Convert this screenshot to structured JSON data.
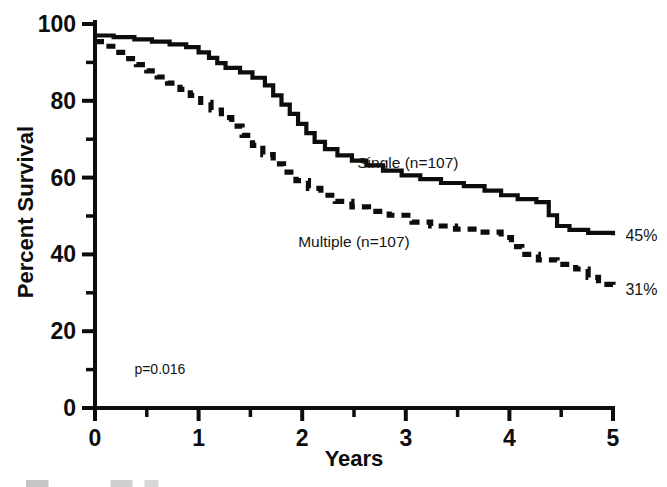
{
  "chart_data": {
    "type": "line",
    "title": "",
    "subtitle": "",
    "xlabel": "Years",
    "ylabel": "Percent Survival",
    "xlim": [
      0,
      5
    ],
    "ylim": [
      0,
      100
    ],
    "grid": false,
    "legend_position": "inline-annotations",
    "x_ticks_major": [
      0,
      1,
      2,
      3,
      4,
      5
    ],
    "x_ticks_major_labels": [
      "0",
      "1",
      "2",
      "3",
      "4",
      "5"
    ],
    "x_ticks_minor": [
      0.5,
      1.5,
      2.5,
      3.5,
      4.5
    ],
    "y_ticks_major": [
      0,
      20,
      40,
      60,
      80,
      100
    ],
    "y_ticks_major_labels": [
      "0",
      "20",
      "40",
      "60",
      "80",
      "100"
    ],
    "y_ticks_minor": [
      10,
      30,
      50,
      70,
      90
    ],
    "annotations": [
      {
        "name": "p-value",
        "text": "p=0.016",
        "x": 0.38,
        "y": 10.5
      },
      {
        "name": "single-endpoint",
        "text": "45%",
        "x": 5.12,
        "y": 45
      },
      {
        "name": "multiple-endpoint",
        "text": "31%",
        "x": 5.12,
        "y": 31
      }
    ],
    "series": [
      {
        "name": "Single",
        "label": "Single (n=107)",
        "n": 107,
        "style": "solid",
        "color": "#0d0d0d",
        "final_value": 45,
        "label_x": 3.02,
        "label_y": 62.5,
        "points": [
          [
            0.0,
            97.0
          ],
          [
            0.18,
            97.0
          ],
          [
            0.18,
            96.6
          ],
          [
            0.38,
            96.6
          ],
          [
            0.38,
            96.0
          ],
          [
            0.55,
            96.0
          ],
          [
            0.55,
            95.4
          ],
          [
            0.72,
            95.4
          ],
          [
            0.72,
            94.7
          ],
          [
            0.88,
            94.7
          ],
          [
            0.88,
            94.0
          ],
          [
            1.0,
            94.0
          ],
          [
            1.0,
            92.6
          ],
          [
            1.1,
            92.6
          ],
          [
            1.1,
            91.2
          ],
          [
            1.18,
            91.2
          ],
          [
            1.18,
            89.8
          ],
          [
            1.26,
            89.8
          ],
          [
            1.26,
            88.6
          ],
          [
            1.4,
            88.6
          ],
          [
            1.4,
            87.4
          ],
          [
            1.52,
            87.4
          ],
          [
            1.52,
            86.0
          ],
          [
            1.64,
            86.0
          ],
          [
            1.64,
            84.0
          ],
          [
            1.72,
            84.0
          ],
          [
            1.72,
            81.4
          ],
          [
            1.8,
            81.4
          ],
          [
            1.8,
            79.0
          ],
          [
            1.88,
            79.0
          ],
          [
            1.88,
            76.6
          ],
          [
            1.96,
            76.6
          ],
          [
            1.96,
            74.0
          ],
          [
            2.04,
            74.0
          ],
          [
            2.04,
            71.6
          ],
          [
            2.12,
            71.6
          ],
          [
            2.12,
            69.3
          ],
          [
            2.22,
            69.3
          ],
          [
            2.22,
            67.4
          ],
          [
            2.34,
            67.4
          ],
          [
            2.34,
            65.8
          ],
          [
            2.48,
            65.8
          ],
          [
            2.48,
            64.4
          ],
          [
            2.62,
            64.4
          ],
          [
            2.62,
            63.2
          ],
          [
            2.78,
            63.2
          ],
          [
            2.78,
            61.8
          ],
          [
            2.96,
            61.8
          ],
          [
            2.96,
            60.6
          ],
          [
            3.14,
            60.6
          ],
          [
            3.14,
            59.6
          ],
          [
            3.34,
            59.6
          ],
          [
            3.34,
            58.6
          ],
          [
            3.56,
            58.6
          ],
          [
            3.56,
            57.8
          ],
          [
            3.76,
            57.8
          ],
          [
            3.76,
            56.6
          ],
          [
            3.92,
            56.6
          ],
          [
            3.92,
            55.4
          ],
          [
            4.08,
            55.4
          ],
          [
            4.08,
            54.4
          ],
          [
            4.26,
            54.4
          ],
          [
            4.26,
            53.6
          ],
          [
            4.38,
            53.6
          ],
          [
            4.38,
            50.2
          ],
          [
            4.46,
            50.2
          ],
          [
            4.46,
            47.4
          ],
          [
            4.58,
            47.4
          ],
          [
            4.58,
            46.4
          ],
          [
            4.76,
            46.4
          ],
          [
            4.76,
            45.6
          ],
          [
            5.0,
            45.6
          ],
          [
            5.0,
            45.0
          ]
        ]
      },
      {
        "name": "Multiple",
        "label": "Multiple (n=107)",
        "n": 107,
        "style": "dashed",
        "color": "#0d0d0d",
        "final_value": 31,
        "label_x": 2.5,
        "label_y": 42.0,
        "points": [
          [
            0.0,
            95.4
          ],
          [
            0.1,
            95.4
          ],
          [
            0.1,
            94.2
          ],
          [
            0.2,
            94.2
          ],
          [
            0.2,
            92.6
          ],
          [
            0.3,
            92.6
          ],
          [
            0.3,
            91.0
          ],
          [
            0.4,
            91.0
          ],
          [
            0.4,
            89.4
          ],
          [
            0.5,
            89.4
          ],
          [
            0.5,
            87.8
          ],
          [
            0.6,
            87.8
          ],
          [
            0.6,
            86.2
          ],
          [
            0.7,
            86.2
          ],
          [
            0.7,
            84.6
          ],
          [
            0.82,
            84.6
          ],
          [
            0.82,
            83.0
          ],
          [
            0.92,
            83.0
          ],
          [
            0.92,
            81.4
          ],
          [
            1.02,
            81.4
          ],
          [
            1.02,
            79.6
          ],
          [
            1.12,
            79.6
          ],
          [
            1.12,
            77.6
          ],
          [
            1.22,
            77.6
          ],
          [
            1.22,
            75.6
          ],
          [
            1.32,
            75.6
          ],
          [
            1.32,
            73.4
          ],
          [
            1.42,
            73.4
          ],
          [
            1.42,
            71.0
          ],
          [
            1.52,
            71.0
          ],
          [
            1.52,
            68.4
          ],
          [
            1.62,
            68.4
          ],
          [
            1.62,
            66.0
          ],
          [
            1.72,
            66.0
          ],
          [
            1.72,
            63.6
          ],
          [
            1.82,
            63.6
          ],
          [
            1.82,
            61.4
          ],
          [
            1.94,
            61.4
          ],
          [
            1.94,
            59.2
          ],
          [
            2.06,
            59.2
          ],
          [
            2.06,
            57.2
          ],
          [
            2.18,
            57.2
          ],
          [
            2.18,
            55.4
          ],
          [
            2.32,
            55.4
          ],
          [
            2.32,
            53.8
          ],
          [
            2.48,
            53.8
          ],
          [
            2.48,
            52.4
          ],
          [
            2.64,
            52.4
          ],
          [
            2.64,
            51.2
          ],
          [
            2.84,
            51.2
          ],
          [
            2.84,
            50.2
          ],
          [
            3.06,
            50.2
          ],
          [
            3.06,
            48.4
          ],
          [
            3.24,
            48.4
          ],
          [
            3.24,
            47.4
          ],
          [
            3.48,
            47.4
          ],
          [
            3.48,
            46.6
          ],
          [
            3.72,
            46.6
          ],
          [
            3.72,
            45.8
          ],
          [
            3.92,
            45.8
          ],
          [
            3.92,
            44.4
          ],
          [
            4.02,
            44.4
          ],
          [
            4.02,
            42.0
          ],
          [
            4.12,
            42.0
          ],
          [
            4.12,
            40.0
          ],
          [
            4.28,
            40.0
          ],
          [
            4.28,
            38.6
          ],
          [
            4.46,
            38.6
          ],
          [
            4.46,
            37.4
          ],
          [
            4.64,
            37.4
          ],
          [
            4.64,
            36.2
          ],
          [
            4.76,
            36.2
          ],
          [
            4.76,
            34.0
          ],
          [
            4.86,
            34.0
          ],
          [
            4.86,
            32.2
          ],
          [
            5.0,
            32.2
          ],
          [
            5.0,
            31.0
          ]
        ]
      }
    ]
  }
}
